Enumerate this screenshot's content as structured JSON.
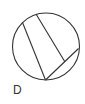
{
  "diagram": {
    "label": "D",
    "stroke_color": "#333333",
    "circle": {
      "cx": 46,
      "cy": 46.5,
      "r": 33.5
    },
    "chords": [
      {
        "x1": 22.5,
        "y1": 22.5,
        "x2": 45.5,
        "y2": 80
      },
      {
        "x1": 36,
        "y1": 14,
        "x2": 65,
        "y2": 62
      },
      {
        "x1": 45.5,
        "y1": 80,
        "x2": 78.5,
        "y2": 48.5
      }
    ]
  }
}
